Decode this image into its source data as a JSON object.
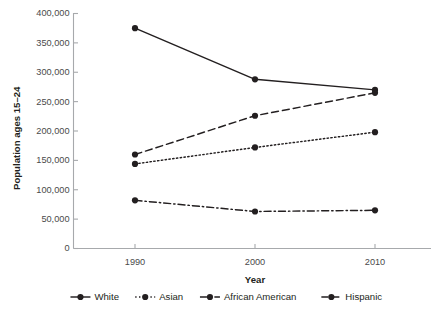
{
  "chart_data": {
    "type": "line",
    "title": "",
    "xlabel": "Year",
    "ylabel": "Population ages 15–24",
    "x": [
      1990,
      2000,
      2010
    ],
    "categories": [
      "1990",
      "2000",
      "2010"
    ],
    "xtick_labels": [
      "1990",
      "2000",
      "2010"
    ],
    "ytick_labels": [
      "0",
      "50,000",
      "100,000",
      "150,000",
      "200,000",
      "250,000",
      "300,000",
      "350,000",
      "400,000"
    ],
    "ytick_values": [
      0,
      50000,
      100000,
      150000,
      200000,
      250000,
      300000,
      350000,
      400000
    ],
    "ylim": [
      0,
      400000
    ],
    "xlim": [
      1990,
      2010
    ],
    "grid": false,
    "legend_position": "bottom",
    "series": [
      {
        "name": "White",
        "style": "solid",
        "color": "#231f20",
        "marker": "circle",
        "values": [
          375000,
          288000,
          270000
        ]
      },
      {
        "name": "Asian",
        "style": "dotted",
        "color": "#231f20",
        "marker": "circle",
        "values": [
          144000,
          172000,
          198000
        ]
      },
      {
        "name": "African American",
        "style": "dashdot",
        "color": "#231f20",
        "marker": "circle",
        "values": [
          82000,
          63000,
          65000
        ]
      },
      {
        "name": "Hispanic",
        "style": "dashed",
        "color": "#231f20",
        "marker": "circle",
        "values": [
          160000,
          226000,
          265000
        ]
      }
    ]
  },
  "legend": {
    "entries": [
      {
        "label": "White",
        "style": "solid"
      },
      {
        "label": "Asian",
        "style": "dotted"
      },
      {
        "label": "African American",
        "style": "dashdot"
      },
      {
        "label": "Hispanic",
        "style": "dashed"
      }
    ]
  },
  "colors": {
    "ink": "#231f20",
    "axis": "#a7a9ac",
    "tick_text": "#4a4a4a",
    "background": "#ffffff"
  }
}
